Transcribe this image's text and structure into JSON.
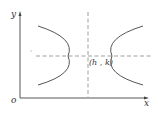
{
  "diagram": {
    "type": "hyperbola",
    "orientation": "horizontal transverse axis",
    "labels": {
      "y_axis": "y",
      "x_axis": "x",
      "origin": "o",
      "center": "(h , k)"
    },
    "colors": {
      "axis": "#444444",
      "curve": "#555555",
      "dashed": "#777777"
    }
  }
}
